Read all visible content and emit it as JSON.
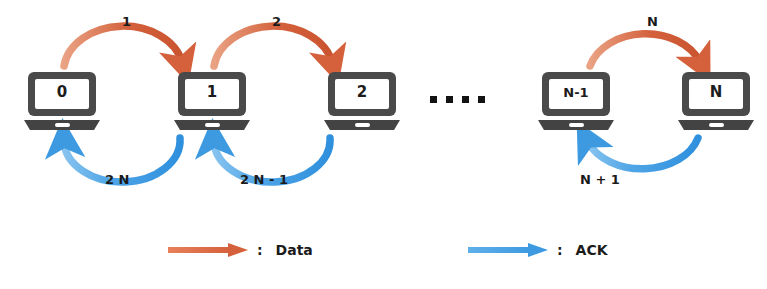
{
  "diagram": {
    "colors": {
      "data_arrow": "#d4613c",
      "ack_arrow": "#3d9ae0",
      "node_body": "#4a4a4a",
      "node_screen": "#ffffff",
      "text": "#1b1b1b",
      "background": "#ffffff"
    },
    "nodes": [
      {
        "id": "n0",
        "label": "0",
        "x": 22,
        "y": 70
      },
      {
        "id": "n1",
        "label": "1",
        "x": 172,
        "y": 70
      },
      {
        "id": "n2",
        "label": "2",
        "x": 322,
        "y": 70
      },
      {
        "id": "nNm1",
        "label": "N-1",
        "x": 536,
        "y": 70
      },
      {
        "id": "nN",
        "label": "N",
        "x": 676,
        "y": 70
      }
    ],
    "ellipsis": {
      "dot_count": 4,
      "x": 430,
      "y": 96
    },
    "data_edges": [
      {
        "from": "0",
        "to": "1",
        "label": "1",
        "label_x": 122,
        "label_y": 14
      },
      {
        "from": "1",
        "to": "2",
        "label": "2",
        "label_x": 272,
        "label_y": 14
      },
      {
        "from": "N-1",
        "to": "N",
        "label": "N",
        "label_x": 647,
        "label_y": 14
      }
    ],
    "ack_edges": [
      {
        "from": "1",
        "to": "0",
        "label": "2 N",
        "label_x": 105,
        "label_y": 172
      },
      {
        "from": "2",
        "to": "1",
        "label": "2 N - 1",
        "label_x": 240,
        "label_y": 172
      },
      {
        "from": "N",
        "to": "N-1",
        "label": "N + 1",
        "label_x": 580,
        "label_y": 172
      }
    ],
    "legend": {
      "items": [
        {
          "icon": "arrow-right-icon",
          "color_key": "data_arrow",
          "separator": ":",
          "label": "Data",
          "x": 168,
          "y": 242
        },
        {
          "icon": "arrow-right-icon",
          "color_key": "ack_arrow",
          "separator": ":",
          "label": "ACK",
          "x": 468,
          "y": 242
        }
      ]
    }
  }
}
